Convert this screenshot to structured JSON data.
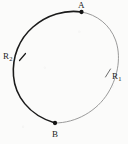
{
  "figure": {
    "kind": "orbit-ellipse-diagram",
    "background_color": "#fbfbfa",
    "ink_dark_color": "#1a1a1a",
    "ink_light_color": "#8e8e8e",
    "canvas": {
      "width": 128,
      "height": 144
    }
  },
  "ellipse": {
    "center_x": 65,
    "center_y": 70,
    "semi_major": 62,
    "semi_minor": 45,
    "rotation_deg": -36,
    "dark_arc_stroke_width": 1.5,
    "light_arc_stroke_width": 0.9
  },
  "points": [
    {
      "id": "A",
      "label": "A",
      "label_x": 78,
      "label_y": 1,
      "marker_x": 81.5,
      "marker_y": 12,
      "marker_radius": 2.1
    },
    {
      "id": "B",
      "label": "B",
      "label_x": 52,
      "label_y": 130,
      "marker_x": 55,
      "marker_y": 123,
      "marker_radius": 2.1
    }
  ],
  "arc_labels": [
    {
      "id": "R1",
      "base": "R",
      "subscript": "1",
      "label_x": 112,
      "label_y": 72,
      "tick_x": 108,
      "tick_y": 73,
      "side": "right"
    },
    {
      "id": "R2",
      "base": "R",
      "subscript": "2",
      "label_x": 3,
      "label_y": 52,
      "tick_x": 22,
      "tick_y": 57,
      "side": "left"
    }
  ]
}
